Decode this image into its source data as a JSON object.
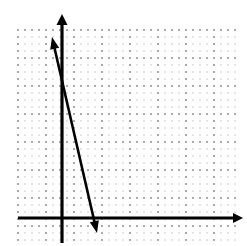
{
  "figure": {
    "kind": "coordinate-plane-line-graph",
    "width": 247,
    "height": 246,
    "background_color": "#ffffff",
    "ink_color": "#000000",
    "grid_dot_color": "#b4b4b4",
    "grid_major_dot_color": "#8c8c8c"
  },
  "grid": {
    "left": 18,
    "top": 30,
    "right": 236,
    "bottom": 240,
    "minor_spacing": 7,
    "major_every": 4,
    "major_spacing": 28,
    "style": "dotted"
  },
  "axes": {
    "x_axis": {
      "label": "",
      "y_pixel": 218,
      "x_start": 18,
      "x_end": 243,
      "arrow_end": "right",
      "stroke_width": 3.2
    },
    "y_axis": {
      "label": "",
      "x_pixel": 62,
      "y_start": 14,
      "y_end": 243,
      "arrow_end": "top",
      "stroke_width": 3.2
    },
    "origin": {
      "x_pixel": 62,
      "y_pixel": 218
    }
  },
  "chart_data": {
    "type": "line",
    "title": "",
    "xlabel": "",
    "ylabel": "",
    "grid": true,
    "legend": false,
    "series": [
      {
        "name": "line",
        "arrow_both_ends": true,
        "stroke_width": 2.6,
        "pixel_points": [
          [
            52,
            37
          ],
          [
            97,
            233
          ]
        ],
        "x": [
          -1.43,
          5.0
        ],
        "y": [
          6.46,
          -2.14
        ],
        "slope": -4.36,
        "y_intercept": 5.6,
        "x_intercept": 1.28
      }
    ],
    "xlim": [
      -6.29,
      24.86
    ],
    "ylim": [
      -3.14,
      26.29
    ],
    "tick_unit_pixels": 7,
    "axis_unit_note": "one grid dot = 1 unit; major gridline every 4 units"
  },
  "artifacts": {
    "corner_mark": {
      "name": "corner-speck",
      "x": 1,
      "y": 8,
      "width": 5,
      "height": 6
    },
    "corner_mark_secondary": {
      "name": "corner-speck-2",
      "x": 1,
      "y": 2,
      "width": 3,
      "height": 4
    }
  }
}
